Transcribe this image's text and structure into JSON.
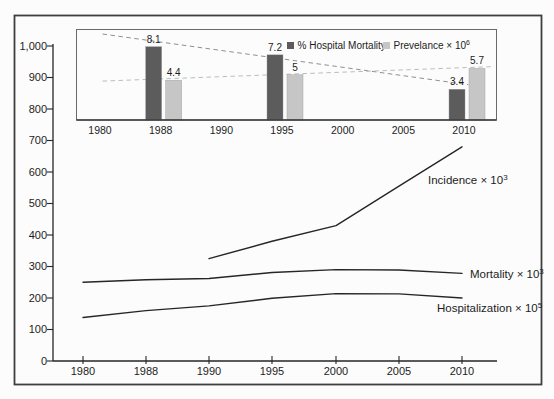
{
  "figure": {
    "background": "#fcfcfc",
    "border_color": "#3f3f3f",
    "text_color": "#1c1c1c",
    "line_color": "#262626"
  },
  "chart_data": [
    {
      "id": "main-line-chart",
      "type": "line",
      "title": "",
      "xlabel": "",
      "ylabel": "",
      "x_categories": [
        "1980",
        "1988",
        "1990",
        "1995",
        "2000",
        "2005",
        "2010"
      ],
      "y_tick_labels": [
        "0",
        "100",
        "200",
        "300",
        "400",
        "500",
        "600",
        "700",
        "800",
        "900",
        "1,000"
      ],
      "ylim": [
        0,
        1000
      ],
      "grid": false,
      "legend_position": "inline-end-of-line-labels",
      "series": [
        {
          "name": "Incidence x 10^3",
          "label_base": "Incidence × 10",
          "label_sup": "3",
          "values": [
            null,
            null,
            325,
            380,
            430,
            555,
            680
          ]
        },
        {
          "name": "Mortality x 10^3",
          "label_base": "Mortality × 10",
          "label_sup": "3",
          "values": [
            250,
            258,
            262,
            281,
            290,
            289,
            278
          ]
        },
        {
          "name": "Hospitalization x 10^5",
          "label_base": "Hospitalization × 10",
          "label_sup": "5",
          "values": [
            138,
            160,
            175,
            199,
            214,
            213,
            200
          ]
        }
      ]
    },
    {
      "id": "inset-bar-chart",
      "type": "bar",
      "title": "",
      "categories": [
        "1980",
        "1988",
        "1990",
        "1995",
        "2000",
        "2005",
        "2010"
      ],
      "ylim": [
        0,
        10
      ],
      "grid": false,
      "series": [
        {
          "name": "% Hospital Mortality",
          "color": "#5c5c5c",
          "values": [
            null,
            8.1,
            null,
            7.2,
            null,
            null,
            3.4
          ],
          "data_labels": [
            "",
            "8.1",
            "",
            "7.2",
            "",
            "",
            "3.4"
          ]
        },
        {
          "name": "Prevelance x 10^6",
          "color": "#c6c6c6",
          "values": [
            null,
            4.4,
            null,
            5,
            null,
            null,
            5.7
          ],
          "data_labels": [
            "",
            "4.4",
            "",
            "5",
            "",
            "",
            "5.7"
          ]
        }
      ],
      "legend": [
        {
          "label_base": "% Hospital Mortality",
          "label_sup": "",
          "color": "#5c5c5c"
        },
        {
          "label_base": "Prevelance × 10",
          "label_sup": "6",
          "color": "#c6c6c6"
        }
      ],
      "trend_lines": [
        {
          "for": "% Hospital Mortality",
          "style": "dashed",
          "color": "#8f8f8f",
          "start_value": 9.5,
          "end_value": 3.9
        },
        {
          "for": "Prevelance x 10^6",
          "style": "dashed",
          "color": "#bcbcbc",
          "start_value": 4.3,
          "end_value": 5.9
        }
      ]
    }
  ]
}
